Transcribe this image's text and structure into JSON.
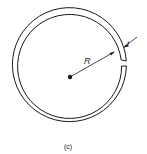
{
  "figure": {
    "caption": "(c)",
    "labels": {
      "radius": "R",
      "thickness": "t"
    },
    "colors": {
      "stroke": "#1a1a1a",
      "background": "#ffffff"
    }
  }
}
